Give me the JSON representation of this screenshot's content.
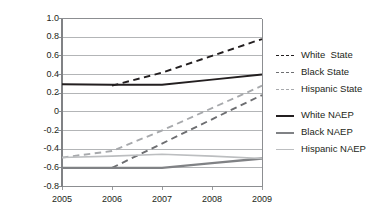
{
  "chart_data": {
    "type": "line",
    "title": "",
    "xlabel": "",
    "ylabel": "Standard deviations",
    "x": [
      2005,
      2006,
      2007,
      2008,
      2009
    ],
    "xticklabels": [
      "2005",
      "2006",
      "2007",
      "2008",
      "2009"
    ],
    "yticklabels": [
      "1.0",
      "0.8",
      "0.6",
      "0.4",
      "0.2",
      "0",
      "-0.2",
      "-0.4",
      "-0.6",
      "-0.8"
    ],
    "yticks": [
      1.0,
      0.8,
      0.6,
      0.4,
      0.2,
      0,
      -0.2,
      -0.4,
      -0.6,
      -0.8
    ],
    "ylim": [
      -0.8,
      1.0
    ],
    "xlim": [
      2005,
      2009
    ],
    "grid": "horizontal",
    "legend_position": "right",
    "series": [
      {
        "name": "White  State",
        "style": "dashed",
        "color": "#231f20",
        "width": 1.9,
        "x": [
          2006,
          2007,
          2008,
          2009
        ],
        "values": [
          0.28,
          0.42,
          0.6,
          0.78
        ]
      },
      {
        "name": "Black State",
        "style": "dashed",
        "color": "#6d6e71",
        "width": 1.9,
        "x": [
          2006,
          2007,
          2008,
          2009
        ],
        "values": [
          -0.6,
          -0.34,
          -0.08,
          0.18
        ]
      },
      {
        "name": "Hispanic State",
        "style": "dashed",
        "color": "#a7a9ac",
        "width": 1.9,
        "x": [
          2005,
          2006,
          2007,
          2008,
          2009
        ],
        "values": [
          -0.49,
          -0.42,
          -0.2,
          0.04,
          0.28
        ]
      },
      {
        "name": "White NAEP",
        "style": "solid",
        "color": "#231f20",
        "width": 2.0,
        "x": [
          2005,
          2006,
          2007,
          2008,
          2009
        ],
        "values": [
          0.295,
          0.29,
          0.29,
          0.345,
          0.4
        ]
      },
      {
        "name": "Black NAEP",
        "style": "solid",
        "color": "#808285",
        "width": 2.4,
        "x": [
          2005,
          2006,
          2007,
          2008,
          2009
        ],
        "values": [
          -0.6,
          -0.6,
          -0.6,
          -0.55,
          -0.5
        ]
      },
      {
        "name": "Hispanic NAEP",
        "style": "solid",
        "color": "#bcbec0",
        "width": 1.6,
        "x": [
          2005,
          2006,
          2007,
          2008,
          2009
        ],
        "values": [
          -0.49,
          -0.475,
          -0.455,
          -0.475,
          -0.5
        ]
      }
    ]
  },
  "legend": {
    "items": [
      {
        "label": "White  State",
        "style": "dashed",
        "color": "#231f20",
        "width": 1.9,
        "gap_before": false
      },
      {
        "label": "Black State",
        "style": "dashed",
        "color": "#6d6e71",
        "width": 1.9,
        "gap_before": false
      },
      {
        "label": "Hispanic State",
        "style": "dashed",
        "color": "#a7a9ac",
        "width": 1.9,
        "gap_before": false
      },
      {
        "label": "White NAEP",
        "style": "solid",
        "color": "#231f20",
        "width": 2.0,
        "gap_before": true
      },
      {
        "label": "Black NAEP",
        "style": "solid",
        "color": "#808285",
        "width": 2.2,
        "gap_before": false
      },
      {
        "label": "Hispanic NAEP",
        "style": "solid",
        "color": "#bcbec0",
        "width": 1.8,
        "gap_before": false
      }
    ]
  },
  "plot_frame": {
    "border_color": "#808285",
    "grid_color": "#939598",
    "background": "#ffffff"
  }
}
